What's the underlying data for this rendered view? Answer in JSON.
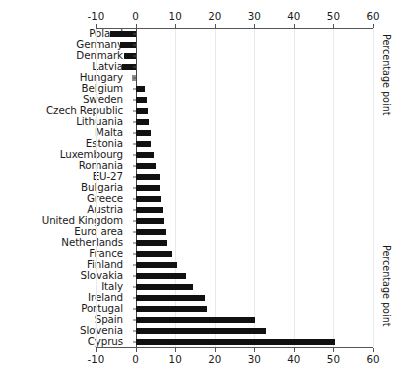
{
  "chart_data": {
    "type": "bar",
    "orientation": "horizontal",
    "title": "",
    "xlabel": "Percentage point",
    "ylabel": "",
    "xlim": [
      -10,
      60
    ],
    "xticks": [
      -10,
      0,
      10,
      20,
      30,
      40,
      50,
      60
    ],
    "xtick_labels": [
      "-10",
      "0",
      "10",
      "20",
      "30",
      "40",
      "50",
      "60"
    ],
    "grid": true,
    "grid_axis": "x",
    "axes_positions": [
      "top",
      "bottom"
    ],
    "bar_color": "#111111",
    "highlight_color": "#8f8f8f",
    "categories": [
      "Poland",
      "Germany",
      "Denmark",
      "Latvia",
      "Hungary",
      "Belgium",
      "Sweden",
      "Czech Republic",
      "Lithuania",
      "Malta",
      "Estonia",
      "Luxembourg",
      "Romania",
      "EU-27",
      "Bulgaria",
      "Greece",
      "Austria",
      "United Kingdom",
      "Euro area",
      "Netherlands",
      "France",
      "Finland",
      "Slovakia",
      "Italy",
      "Ireland",
      "Portugal",
      "Spain",
      "Slovenia",
      "Cyprus"
    ],
    "values": [
      -6.5,
      -4.0,
      -3.0,
      -3.5,
      -1.0,
      2.5,
      3.0,
      3.2,
      3.5,
      3.9,
      4.0,
      4.6,
      5.1,
      6.2,
      6.3,
      6.5,
      6.9,
      7.2,
      7.6,
      7.9,
      9.1,
      10.4,
      12.7,
      14.4,
      17.6,
      18.0,
      30.1,
      32.9,
      50.5
    ],
    "highlight_categories": [
      "Hungary"
    ],
    "right_labels": [
      "Percentage point",
      "Percentage point"
    ]
  }
}
